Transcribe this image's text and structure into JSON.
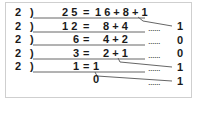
{
  "diagram": {
    "divisor": "2",
    "bracket": ")",
    "rows": [
      {
        "divisor": "2",
        "dividend": "2 5",
        "eq": "=",
        "expr": "1 6 + 8 + 1",
        "remainder": "1",
        "dots": "......"
      },
      {
        "divisor": "2",
        "dividend": "1 2",
        "eq": "=",
        "expr": "8 + 4",
        "remainder": "0",
        "dots": "......"
      },
      {
        "divisor": "2",
        "dividend": "6",
        "eq": "=",
        "expr": "4 + 2",
        "remainder": "0",
        "dots": "......"
      },
      {
        "divisor": "2",
        "dividend": "3",
        "eq": "=",
        "expr": "2 + 1",
        "remainder": "1",
        "dots": "......"
      },
      {
        "divisor": "2",
        "dividend": "1",
        "eq": "=",
        "expr": "1",
        "remainder": "1",
        "dots": "......"
      }
    ],
    "final_quotient": "0",
    "colors": {
      "text": "#1a1a1a",
      "line": "#555555",
      "border": "#cfcfcf"
    }
  }
}
